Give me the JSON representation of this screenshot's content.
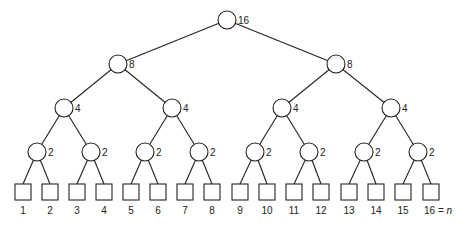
{
  "diagram": {
    "type": "binary-tree",
    "levels": [
      {
        "nodes": [
          {
            "x": 227,
            "y": 20,
            "label": "16"
          }
        ]
      },
      {
        "nodes": [
          {
            "x": 118,
            "y": 64,
            "label": "8"
          },
          {
            "x": 336,
            "y": 64,
            "label": "8"
          }
        ]
      },
      {
        "nodes": [
          {
            "x": 64,
            "y": 108,
            "label": "4"
          },
          {
            "x": 172,
            "y": 108,
            "label": "4"
          },
          {
            "x": 282,
            "y": 108,
            "label": "4"
          },
          {
            "x": 391,
            "y": 108,
            "label": "4"
          }
        ]
      },
      {
        "nodes": [
          {
            "x": 37,
            "y": 152,
            "label": "2"
          },
          {
            "x": 91,
            "y": 152,
            "label": "2"
          },
          {
            "x": 145,
            "y": 152,
            "label": "2"
          },
          {
            "x": 199,
            "y": 152,
            "label": "2"
          },
          {
            "x": 255,
            "y": 152,
            "label": "2"
          },
          {
            "x": 309,
            "y": 152,
            "label": "2"
          },
          {
            "x": 364,
            "y": 152,
            "label": "2"
          },
          {
            "x": 418,
            "y": 152,
            "label": "2"
          }
        ]
      }
    ],
    "leaves": [
      {
        "x": 23,
        "label": "1"
      },
      {
        "x": 50,
        "label": "2"
      },
      {
        "x": 77,
        "label": "3"
      },
      {
        "x": 104,
        "label": "4"
      },
      {
        "x": 131,
        "label": "5"
      },
      {
        "x": 158,
        "label": "6"
      },
      {
        "x": 185,
        "label": "7"
      },
      {
        "x": 212,
        "label": "8"
      },
      {
        "x": 240,
        "label": "9"
      },
      {
        "x": 267,
        "label": "10"
      },
      {
        "x": 294,
        "label": "11"
      },
      {
        "x": 321,
        "label": "12"
      },
      {
        "x": 349,
        "label": "13"
      },
      {
        "x": 376,
        "label": "14"
      },
      {
        "x": 403,
        "label": "15"
      },
      {
        "x": 431,
        "label": "16 = n"
      }
    ],
    "node_radius": 9,
    "leaf_size": 16,
    "leaf_top": 184,
    "leaf_label_y": 214,
    "stroke_color": "#222222"
  }
}
